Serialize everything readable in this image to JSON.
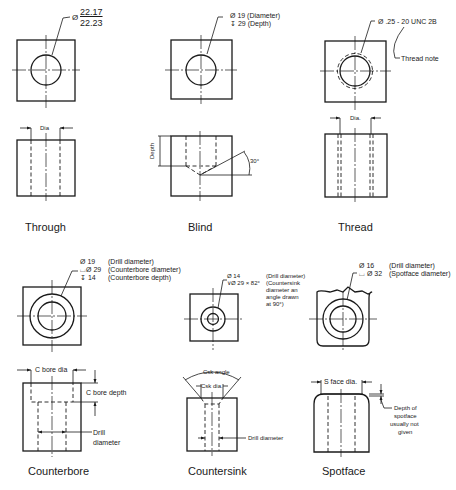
{
  "figures": [
    {
      "id": "through",
      "caption": "Through",
      "note": {
        "symbol": "Ø",
        "upper": "22.17",
        "lower": "22.23"
      },
      "labels": {
        "dia": "Dia"
      }
    },
    {
      "id": "blind",
      "caption": "Blind",
      "note": {
        "line1": "Ø  19 (Diameter)",
        "line2": "↧ 29 (Depth)"
      },
      "labels": {
        "depth": "Depth",
        "angle": "30°"
      }
    },
    {
      "id": "thread",
      "caption": "Thread",
      "note": {
        "line1": "Ø .25 - 20 UNC 2B",
        "thread_note": "Thread note"
      },
      "labels": {
        "dia": "Dia."
      }
    },
    {
      "id": "counterbore",
      "caption": "Counterbore",
      "note": {
        "rows": [
          {
            "sym": "Ø  19",
            "desc": "(Drill diameter)"
          },
          {
            "sym": "⌴Ø  29",
            "desc": "(Counterbore diameter)"
          },
          {
            "sym": "↧  14",
            "desc": "(Counterbore depth)"
          }
        ]
      },
      "labels": {
        "cbore_dia": "C bore dia",
        "cbore_depth": "C bore depth",
        "drill_dia_1": "Drill",
        "drill_dia_2": "diameter"
      }
    },
    {
      "id": "countersink",
      "caption": "Countersink",
      "note": {
        "line1": "Ø 14",
        "line2": "∨Ø 29 × 82°",
        "desc1": "(Drill diameter)",
        "desc2": "(Countersink",
        "desc3": "diameter an",
        "desc4": "angle drawn",
        "desc5": "at 90°)"
      },
      "labels": {
        "csk_angle": "Csk angle",
        "csk_dia": "Csk dia.",
        "drill_dia": "Drill diameter"
      }
    },
    {
      "id": "spotface",
      "caption": "Spotface",
      "note": {
        "rows": [
          {
            "sym": "Ø 16",
            "desc": "(Drill diameter)"
          },
          {
            "sym": "⌴ Ø 32",
            "desc": "(Spotface diameter)"
          }
        ]
      },
      "labels": {
        "sface_dia": "S face dia.",
        "depth_1": "Depth of",
        "depth_2": "spotface",
        "depth_3": "usually not",
        "depth_4": "given"
      }
    }
  ]
}
